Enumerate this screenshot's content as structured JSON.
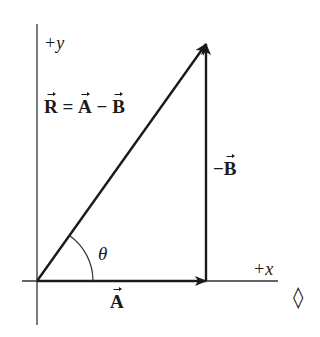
{
  "diagram": {
    "axes": {
      "y_label": "+y",
      "x_label": "+x"
    },
    "vectors": {
      "a": {
        "symbol": "A",
        "label": "A"
      },
      "neg_b": {
        "symbol": "-B",
        "minus": "−",
        "letter": "B"
      },
      "r": {
        "symbol": "R"
      }
    },
    "equation": {
      "lhs": "R",
      "equals": " = ",
      "term1": "A",
      "minus": " − ",
      "term2": "B"
    },
    "angle": {
      "symbol": "θ"
    },
    "marker": {
      "symbol": "◊"
    },
    "colors": {
      "ink": "#1a1a1a",
      "axis": "#333333",
      "background": "#ffffff"
    }
  }
}
